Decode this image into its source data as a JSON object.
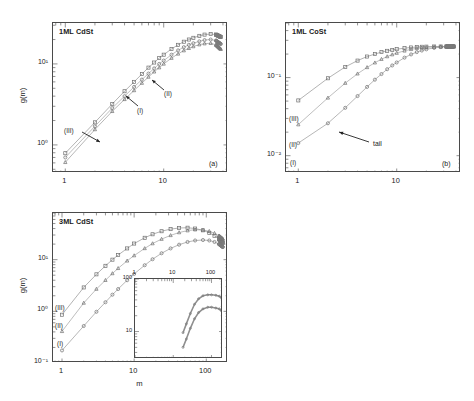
{
  "figure": {
    "axis_label_x": "m",
    "axis_label_y": "g(m)",
    "annotation_tail": "tail"
  },
  "panels": [
    {
      "id": "(a)",
      "title": "1ML CdSt",
      "xticks": [
        "1",
        "10"
      ],
      "yticks": [
        "10⁰",
        "10¹"
      ],
      "curve_labels": [
        "(I)",
        "(II)",
        "(III)"
      ],
      "show_x_label": false,
      "show_y_label": true,
      "has_inset": false,
      "has_tail": false
    },
    {
      "id": "(b)",
      "title": "1ML CoSt",
      "xticks": [
        "1",
        "10"
      ],
      "yticks": [
        "10⁻¹",
        "10⁻²"
      ],
      "curve_labels": [
        "(I)",
        "(II)",
        "(III)"
      ],
      "show_x_label": false,
      "show_y_label": false,
      "has_inset": false,
      "has_tail": true
    },
    {
      "id": "(c)",
      "title": "3ML CdSt",
      "xticks": [
        "1",
        "10",
        "100"
      ],
      "yticks": [
        "10⁻¹",
        "10⁰",
        "10¹"
      ],
      "curve_labels": [
        "(I)",
        "(II)",
        "(III)"
      ],
      "show_x_label": true,
      "show_y_label": true,
      "has_inset": true,
      "has_tail": false,
      "inset": {
        "xticks": [
          "1",
          "10",
          "100"
        ],
        "yticks": [
          "100",
          "10"
        ],
        "curve_labels": [
          "(IV)",
          "(V)"
        ]
      }
    },
    {
      "id": "(d)",
      "title": "3ML CoSt",
      "xticks": [
        "1",
        "10"
      ],
      "yticks": [
        "10⁻¹",
        "10⁻²"
      ],
      "curve_labels": [
        "(I)",
        "(II)",
        "(III)"
      ],
      "show_x_label": true,
      "show_y_label": false,
      "has_inset": true,
      "has_tail": true,
      "inset": {
        "xticks": [
          "1",
          "10",
          "100"
        ],
        "yticks": [
          "1",
          "0.1"
        ],
        "curve_labels": [
          "(IV)",
          "(V)"
        ]
      }
    }
  ],
  "chart_data": [
    {
      "type": "scatter",
      "panel": "(a)",
      "title": "1ML CdSt",
      "xlabel": "m",
      "ylabel": "g(m)",
      "xscale": "log",
      "yscale": "log",
      "xlim": [
        0.75,
        45
      ],
      "ylim": [
        0.45,
        32
      ],
      "grid": false,
      "legend": "in-plot arrow labels",
      "series": [
        {
          "name": "(III)",
          "marker": "square",
          "x": [
            1,
            2,
            3,
            4,
            5,
            6,
            7,
            8,
            9,
            10,
            12,
            14,
            16,
            18,
            20,
            23,
            26,
            30,
            34,
            38
          ],
          "y": [
            0.79,
            1.9,
            3.2,
            4.6,
            6.0,
            7.5,
            9.0,
            10.4,
            11.8,
            13.0,
            15.3,
            17.2,
            18.8,
            20.0,
            21.0,
            22.2,
            23.0,
            23.4,
            23.0,
            21.5
          ]
        },
        {
          "name": "(I)",
          "marker": "circle",
          "x": [
            1,
            2,
            3,
            4,
            5,
            6,
            7,
            8,
            9,
            10,
            12,
            14,
            16,
            18,
            20,
            23,
            26,
            30,
            34,
            38
          ],
          "y": [
            0.7,
            1.7,
            2.85,
            4.0,
            5.2,
            6.4,
            7.6,
            8.8,
            10.0,
            11.0,
            13.0,
            14.7,
            16.1,
            17.2,
            18.0,
            19.0,
            19.7,
            20.0,
            19.4,
            17.6
          ]
        },
        {
          "name": "(II)",
          "marker": "triangle",
          "x": [
            1,
            2,
            3,
            4,
            5,
            6,
            7,
            8,
            9,
            10,
            12,
            14,
            16,
            18,
            20,
            23,
            26,
            30,
            34,
            38
          ],
          "y": [
            0.61,
            1.55,
            2.6,
            3.65,
            4.7,
            5.8,
            6.9,
            8.0,
            9.0,
            10.0,
            11.8,
            13.3,
            14.6,
            15.6,
            16.4,
            17.3,
            17.8,
            18.0,
            17.2,
            15.2
          ]
        }
      ]
    },
    {
      "type": "scatter",
      "panel": "(b)",
      "title": "1ML CoSt",
      "xlabel": "m",
      "ylabel": "g(m)",
      "xscale": "log",
      "yscale": "log",
      "xlim": [
        0.75,
        45
      ],
      "ylim": [
        0.006,
        0.5
      ],
      "grid": false,
      "legend": "in-plot labels (I) (II) (III) at left axis",
      "annotations": [
        "tail"
      ],
      "series": [
        {
          "name": "(III)",
          "marker": "square",
          "x": [
            1,
            2,
            3,
            4,
            5,
            6,
            7,
            8,
            9,
            10,
            12,
            14,
            16,
            18,
            20,
            24,
            28,
            32,
            38
          ],
          "y": [
            0.051,
            0.098,
            0.137,
            0.165,
            0.186,
            0.2,
            0.212,
            0.22,
            0.226,
            0.231,
            0.238,
            0.243,
            0.246,
            0.248,
            0.249,
            0.25,
            0.25,
            0.25,
            0.25
          ]
        },
        {
          "name": "(II)",
          "marker": "triangle",
          "x": [
            1,
            2,
            3,
            4,
            5,
            6,
            7,
            8,
            9,
            10,
            12,
            14,
            16,
            18,
            20,
            24,
            28,
            32,
            38
          ],
          "y": [
            0.025,
            0.055,
            0.085,
            0.112,
            0.135,
            0.155,
            0.172,
            0.186,
            0.197,
            0.206,
            0.22,
            0.23,
            0.237,
            0.241,
            0.244,
            0.247,
            0.249,
            0.25,
            0.25
          ]
        },
        {
          "name": "(I)",
          "marker": "circle",
          "x": [
            1,
            2,
            3,
            4,
            5,
            6,
            7,
            8,
            9,
            10,
            12,
            14,
            16,
            18,
            20,
            24,
            28,
            32,
            38
          ],
          "y": [
            0.0145,
            0.026,
            0.041,
            0.058,
            0.076,
            0.094,
            0.111,
            0.128,
            0.143,
            0.156,
            0.18,
            0.198,
            0.212,
            0.222,
            0.23,
            0.24,
            0.246,
            0.249,
            0.252
          ]
        }
      ]
    },
    {
      "type": "scatter",
      "panel": "(c)",
      "title": "3ML CdSt",
      "xlabel": "m",
      "ylabel": "g(m)",
      "xscale": "log",
      "yscale": "log",
      "xlim": [
        0.75,
        200
      ],
      "ylim": [
        0.1,
        80
      ],
      "grid": false,
      "legend": "in-plot labels (I) (II) (III) at left axis",
      "series": [
        {
          "name": "(III)",
          "marker": "square",
          "x": [
            1,
            2,
            3,
            4,
            5,
            6,
            8,
            10,
            14,
            18,
            24,
            32,
            42,
            55,
            70,
            90,
            110,
            130,
            150,
            170
          ],
          "y": [
            0.86,
            2.9,
            5.2,
            7.6,
            10.0,
            12.3,
            16.5,
            20.5,
            26.5,
            31.0,
            35.5,
            39.0,
            41.0,
            41.5,
            40.0,
            37.0,
            33.0,
            29.0,
            25.0,
            21.0
          ]
        },
        {
          "name": "(II)",
          "marker": "triangle",
          "x": [
            1,
            2,
            3,
            4,
            5,
            6,
            8,
            10,
            14,
            18,
            24,
            32,
            42,
            55,
            70,
            90,
            110,
            130,
            150,
            170
          ],
          "y": [
            0.41,
            1.45,
            2.7,
            4.0,
            5.4,
            6.8,
            9.5,
            12.0,
            16.5,
            20.5,
            25.0,
            29.5,
            33.5,
            36.5,
            38.0,
            37.5,
            35.5,
            32.5,
            29.0,
            25.0
          ]
        },
        {
          "name": "(I)",
          "marker": "circle",
          "x": [
            1,
            2,
            3,
            4,
            5,
            6,
            8,
            10,
            14,
            18,
            24,
            32,
            42,
            55,
            70,
            90,
            110,
            130,
            150,
            170
          ],
          "y": [
            0.175,
            0.52,
            0.98,
            1.5,
            2.1,
            2.7,
            4.0,
            5.3,
            7.8,
            10.2,
            13.3,
            16.5,
            19.5,
            22.0,
            23.5,
            24.0,
            23.5,
            22.0,
            20.0,
            17.5
          ]
        }
      ],
      "inset": {
        "type": "line",
        "xscale": "log",
        "yscale": "log",
        "xlim": [
          1,
          200
        ],
        "ylim": [
          3,
          100
        ],
        "xticks": [
          1,
          10,
          100
        ],
        "yticks": [
          10,
          100
        ],
        "series": [
          {
            "name": "(V)",
            "x": [
              18,
              22,
              28,
              36,
              46,
              60,
              80,
              100,
              130,
              160,
              180
            ],
            "y": [
              9.5,
              14,
              22,
              33,
              42,
              48,
              50,
              50,
              49,
              47,
              44
            ]
          },
          {
            "name": "(IV)",
            "x": [
              18,
              22,
              28,
              36,
              46,
              60,
              80,
              100,
              130,
              160,
              180
            ],
            "y": [
              5.0,
              7.2,
              11.5,
              17.5,
              23,
              27,
              29,
              29,
              28,
              27,
              25
            ]
          }
        ]
      }
    },
    {
      "type": "scatter",
      "panel": "(d)",
      "title": "3ML CoSt",
      "xlabel": "m",
      "ylabel": "g(m)",
      "xscale": "log",
      "yscale": "log",
      "xlim": [
        0.75,
        60
      ],
      "ylim": [
        0.004,
        0.2
      ],
      "grid": false,
      "legend": "in-plot labels (I) (II) (III) at left axis",
      "annotations": [
        "tail"
      ],
      "series": [
        {
          "name": "(III)",
          "marker": "square",
          "x": [
            1,
            2,
            3,
            4,
            5,
            6,
            8,
            10,
            13,
            16,
            20,
            25,
            31,
            38,
            45,
            52
          ],
          "y": [
            0.0195,
            0.031,
            0.04,
            0.047,
            0.053,
            0.058,
            0.065,
            0.07,
            0.076,
            0.08,
            0.084,
            0.087,
            0.089,
            0.09,
            0.091,
            0.091
          ]
        },
        {
          "name": "(II)",
          "marker": "triangle",
          "x": [
            1,
            2,
            3,
            4,
            5,
            6,
            8,
            10,
            13,
            16,
            20,
            25,
            31,
            38,
            45,
            52
          ],
          "y": [
            0.0165,
            0.0235,
            0.0295,
            0.0345,
            0.0385,
            0.042,
            0.048,
            0.0525,
            0.058,
            0.062,
            0.066,
            0.0695,
            0.0725,
            0.075,
            0.0765,
            0.0775
          ]
        },
        {
          "name": "(I)",
          "marker": "circle",
          "x": [
            1,
            2,
            3,
            4,
            5,
            6,
            8,
            10,
            13,
            16,
            20,
            25,
            31,
            38,
            45,
            52
          ],
          "y": [
            0.0145,
            0.0205,
            0.0255,
            0.0295,
            0.033,
            0.036,
            0.041,
            0.045,
            0.05,
            0.054,
            0.058,
            0.0615,
            0.0645,
            0.0665,
            0.068,
            0.069
          ]
        },
        {
          "name": "tail-curve",
          "marker": "line",
          "x": [
            1,
            2,
            3,
            4,
            5,
            6,
            8,
            10,
            13,
            16,
            20,
            25,
            31,
            38,
            45,
            52
          ],
          "y": [
            0.006,
            0.0105,
            0.015,
            0.0195,
            0.0235,
            0.0275,
            0.034,
            0.04,
            0.0475,
            0.0535,
            0.06,
            0.0665,
            0.072,
            0.077,
            0.08,
            0.082
          ]
        }
      ],
      "inset": {
        "type": "line",
        "xscale": "log",
        "yscale": "log",
        "xlim": [
          1,
          200
        ],
        "ylim": [
          0.04,
          1
        ],
        "xticks": [
          1,
          10,
          100
        ],
        "yticks": [
          0.1,
          1
        ],
        "series": [
          {
            "name": "(V)",
            "x": [
              1.3,
              2,
              3,
              5,
              8,
              13,
              22,
              36,
              60,
              100,
              160
            ],
            "y": [
              0.2,
              0.27,
              0.34,
              0.4,
              0.44,
              0.455,
              0.462,
              0.468,
              0.472,
              0.478,
              0.495
            ]
          },
          {
            "name": "(IV)",
            "x": [
              1.3,
              2,
              3,
              5,
              8,
              13,
              22,
              36,
              60,
              100,
              160
            ],
            "y": [
              0.055,
              0.075,
              0.09,
              0.1,
              0.107,
              0.112,
              0.117,
              0.121,
              0.125,
              0.129,
              0.133
            ]
          }
        ]
      }
    }
  ]
}
